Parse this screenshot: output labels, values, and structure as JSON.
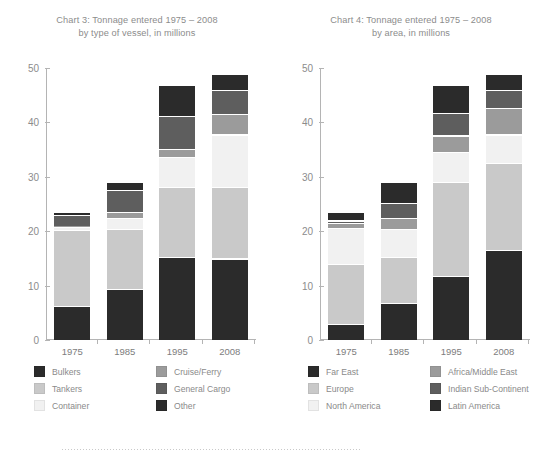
{
  "chart_data": [
    {
      "type": "bar",
      "stacked": true,
      "title": "Chart 3: Tonnage entered 1975 – 2008",
      "subtitle": "by type of vessel, in millions",
      "xlabel": "",
      "ylabel": "",
      "ylim": [
        0,
        50
      ],
      "yticks": [
        0,
        10,
        20,
        30,
        40,
        50
      ],
      "grid": false,
      "legend_position": "bottom",
      "categories": [
        "1975",
        "1985",
        "1995",
        "2008"
      ],
      "series": [
        {
          "name": "Bulkers",
          "color": "#2b2b2b",
          "values": [
            6.2,
            9.4,
            15.3,
            15.0
          ]
        },
        {
          "name": "Tankers",
          "color": "#c9c9c9",
          "values": [
            14.0,
            11.0,
            12.8,
            13.2
          ]
        },
        {
          "name": "Container",
          "color": "#f1f1f1",
          "values": [
            0.6,
            2.1,
            5.6,
            9.6
          ]
        },
        {
          "name": "Cruise/Ferry",
          "color": "#9b9b9b",
          "values": [
            0.2,
            1.1,
            1.4,
            3.8
          ]
        },
        {
          "name": "General Cargo",
          "color": "#5e5e5e",
          "values": [
            2.0,
            4.0,
            6.1,
            4.4
          ]
        },
        {
          "name": "Other",
          "color": "#2b2b2b",
          "values": [
            0.5,
            1.4,
            5.8,
            3.0
          ]
        }
      ],
      "totals": [
        23.5,
        29.0,
        47.0,
        49.0
      ]
    },
    {
      "type": "bar",
      "stacked": true,
      "title": "Chart 4: Tonnage entered 1975 – 2008",
      "subtitle": "by area, in millions",
      "xlabel": "",
      "ylabel": "",
      "ylim": [
        0,
        50
      ],
      "yticks": [
        0,
        10,
        20,
        30,
        40,
        50
      ],
      "grid": false,
      "legend_position": "bottom",
      "categories": [
        "1975",
        "1985",
        "1995",
        "2008"
      ],
      "series": [
        {
          "name": "Far East",
          "color": "#2b2b2b",
          "values": [
            2.9,
            6.8,
            11.8,
            16.6
          ]
        },
        {
          "name": "Europe",
          "color": "#c9c9c9",
          "values": [
            11.1,
            8.5,
            17.2,
            16.0
          ]
        },
        {
          "name": "North America",
          "color": "#f1f1f1",
          "values": [
            6.6,
            5.1,
            5.6,
            5.2
          ]
        },
        {
          "name": "Africa/Middle East",
          "color": "#9b9b9b",
          "values": [
            1.0,
            2.1,
            3.0,
            4.8
          ]
        },
        {
          "name": "Indian Sub-Continent",
          "color": "#5e5e5e",
          "values": [
            0.4,
            2.7,
            4.2,
            3.4
          ]
        },
        {
          "name": "Latin America",
          "color": "#2b2b2b",
          "values": [
            1.5,
            3.8,
            5.2,
            3.0
          ]
        }
      ],
      "totals": [
        23.5,
        29.0,
        47.0,
        49.0
      ]
    }
  ]
}
